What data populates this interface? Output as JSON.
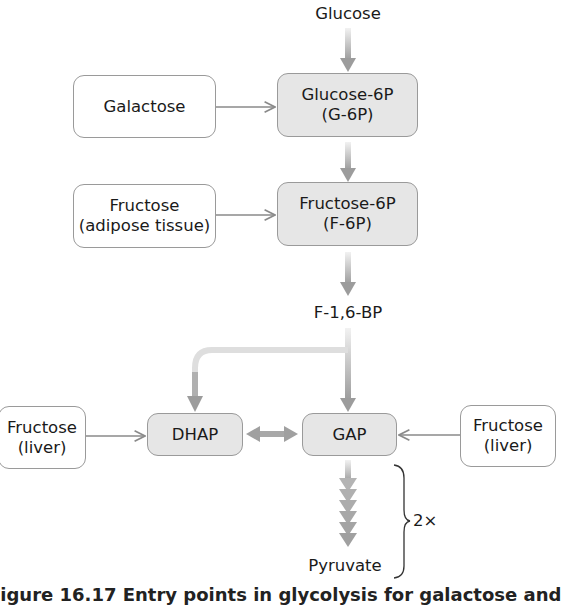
{
  "nodes": {
    "glucose": "Glucose",
    "galactose": "Galactose",
    "g6p": {
      "line1": "Glucose-6P",
      "line2": "(G-6P)"
    },
    "fructose_adipose": {
      "line1": "Fructose",
      "line2": "(adipose tissue)"
    },
    "f6p": {
      "line1": "Fructose-6P",
      "line2": "(F-6P)"
    },
    "f16bp": "F-1,6-BP",
    "fructose_liver_left": {
      "line1": "Fructose",
      "line2": "(liver)"
    },
    "dhap": "DHAP",
    "gap": "GAP",
    "fructose_liver_right": {
      "line1": "Fructose",
      "line2": "(liver)"
    },
    "pyruvate": "Pyruvate"
  },
  "multiplier": "2×",
  "caption": "Figure 16.17 Entry points in glycolysis for galactose and",
  "colors": {
    "box_border": "#9a9a9a",
    "highlight_fill": "#e6e6e6",
    "arrow_dark": "#9a9a9a",
    "arrow_light": "#e8e8e8",
    "thin_arrow": "#8a8a8a"
  }
}
